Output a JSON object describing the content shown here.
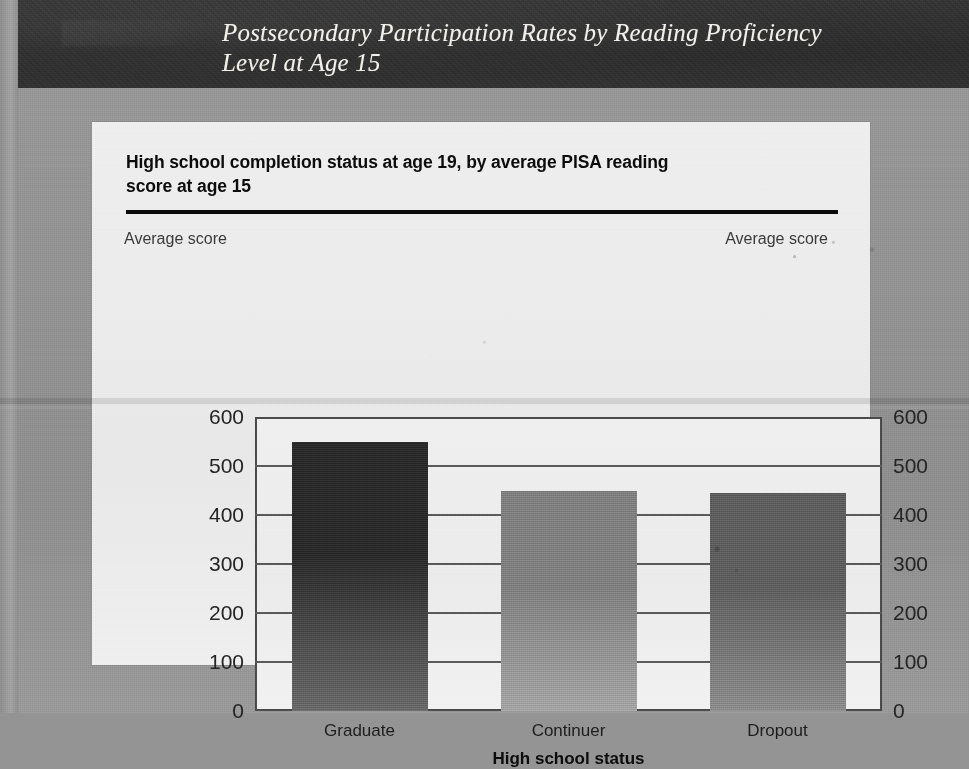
{
  "header": {
    "title_line1": "Postsecondary Participation Rates by Reading Proficiency",
    "title_line2": "Level at Age 15",
    "band_color": "#2e2e2e",
    "text_color": "#f2f0ea"
  },
  "card": {
    "background_color": "#ededed",
    "chart_title_line1": "High school completion status at age 19, by average PISA reading",
    "chart_title_line2": "score at age 15",
    "rule_color": "#0b0b0b",
    "left_axis_caption": "Average score",
    "right_axis_caption": "Average score"
  },
  "chart_data": {
    "type": "bar",
    "title": "High school completion status at age 19, by average PISA reading score at age 15",
    "categories": [
      "Graduate",
      "Continuer",
      "Dropout"
    ],
    "values": [
      550,
      450,
      445
    ],
    "series": [
      {
        "name": "Average PISA reading score at age 15",
        "values": [
          550,
          450,
          445
        ]
      }
    ],
    "xlabel": "High school status",
    "ylabel": "Average score",
    "ylabel_right": "Average score",
    "ylim": [
      0,
      600
    ],
    "ytick_values": [
      600,
      500,
      400,
      300,
      200,
      100,
      0
    ],
    "ytick_labels": [
      "600",
      "500",
      "400",
      "300",
      "200",
      "100",
      "0"
    ],
    "ytick_labels_right": [
      "600",
      "500",
      "400",
      "300",
      "200",
      "100",
      "0"
    ],
    "grid": true,
    "grid_axis": "y",
    "legend": false,
    "bar_colors": [
      "#262626",
      "#7f7f7f",
      "#5c5c5c"
    ],
    "bar_style": "vertical gradient, dark at top to lighter at bottom"
  }
}
